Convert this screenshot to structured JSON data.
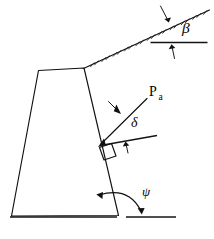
{
  "figure": {
    "type": "engineering-diagram",
    "background_color": "#ffffff",
    "line_color": "#111111"
  },
  "labels": {
    "backfill_slope_angle": "β",
    "wall_friction_angle": "δ",
    "wall_base_angle": "ψ",
    "active_force_symbol": "P",
    "active_force_subscript": "a"
  },
  "elements": {
    "wall": {
      "name": "gravity-retaining-wall",
      "shape": "trapezoid",
      "top_left": [
        38,
        70
      ],
      "top_right": [
        84,
        68
      ],
      "bottom_right": [
        118,
        216
      ],
      "bottom_left": [
        11,
        216
      ]
    },
    "backfill_slope": {
      "name": "sloped-ground-surface",
      "start": [
        84,
        68
      ],
      "end": [
        209,
        10
      ],
      "hatching": true
    },
    "base_ground_line": {
      "name": "base-ground-line",
      "start": [
        10,
        217
      ],
      "end": [
        176,
        217
      ]
    },
    "beta_reference_line": {
      "name": "beta-horizontal-reference",
      "start": [
        150,
        42
      ],
      "end": [
        207,
        42
      ]
    },
    "delta_reference_line": {
      "name": "delta-horizontal-reference",
      "start": [
        100,
        146
      ],
      "end": [
        157,
        136
      ]
    },
    "active_force_line": {
      "name": "active-force-vector",
      "tail": [
        147,
        98
      ],
      "head": [
        100,
        145
      ]
    },
    "right_angle_marker": {
      "name": "right-angle-marker",
      "location": [
        103,
        148
      ]
    },
    "psi_arc": {
      "name": "psi-angle-arc",
      "double_headed": true
    }
  },
  "annotations": {
    "beta_position": [
      182,
      33
    ],
    "delta_position": [
      131,
      127
    ],
    "psi_position": [
      143,
      196
    ],
    "pa_position": [
      152,
      96
    ]
  }
}
